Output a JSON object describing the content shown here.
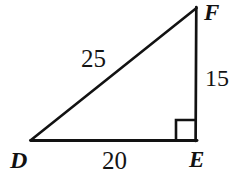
{
  "figure": {
    "kind": "right-triangle-diagram",
    "background_color": "#ffffff",
    "stroke_color": "#111111",
    "vertices": [
      {
        "name": "D",
        "label": "D",
        "x": 31,
        "y": 140
      },
      {
        "name": "E",
        "label": "E",
        "x": 196,
        "y": 140
      },
      {
        "name": "F",
        "label": "F",
        "x": 196,
        "y": 7
      }
    ],
    "sides": [
      {
        "name": "hypotenuse-DF",
        "label": "25",
        "from": "D",
        "to": "F"
      },
      {
        "name": "base-DE",
        "label": "20",
        "from": "D",
        "to": "E"
      },
      {
        "name": "leg-EF",
        "label": "15",
        "from": "E",
        "to": "F"
      }
    ],
    "right_angle": {
      "at_vertex": "E",
      "marker": "square",
      "size": 20
    },
    "vertex_labels": {
      "D": "D",
      "E": "E",
      "F": "F"
    },
    "side_labels": {
      "hypotenuse": "25",
      "base": "20",
      "vertical_leg": "15"
    }
  }
}
